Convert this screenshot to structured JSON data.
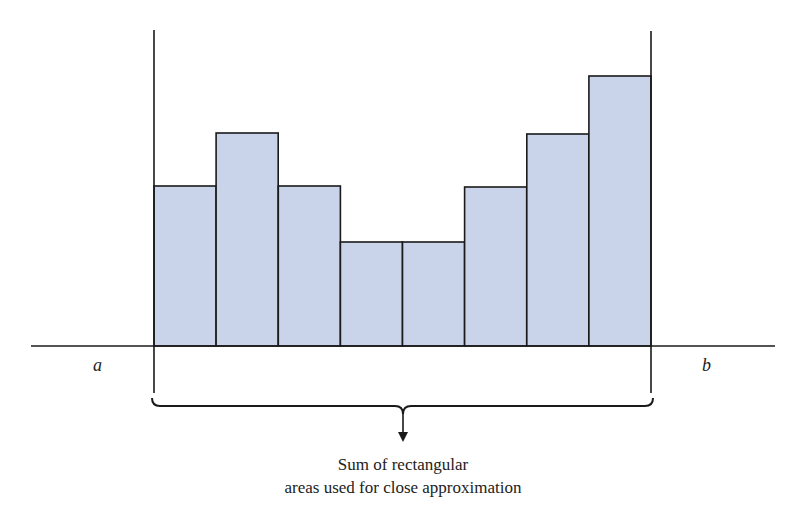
{
  "diagram": {
    "labels": {
      "left_bound": "a",
      "right_bound": "b"
    },
    "caption": {
      "line1": "Sum of rectangular",
      "line2": "areas used for close approximation"
    },
    "colors": {
      "bar_fill": "#c9d4ea",
      "stroke": "#1a1a1a",
      "background": "#ffffff"
    }
  },
  "chart_data": {
    "type": "bar",
    "title": "",
    "xlabel": "",
    "ylabel": "",
    "categories": [
      "1",
      "2",
      "3",
      "4",
      "5",
      "6",
      "7",
      "8"
    ],
    "values": [
      160,
      213,
      160,
      104,
      104,
      159,
      212,
      270
    ],
    "x_bounds": [
      "a",
      "b"
    ],
    "grid": false,
    "legend": "none",
    "annotation": "Sum of rectangular areas used for close approximation"
  }
}
